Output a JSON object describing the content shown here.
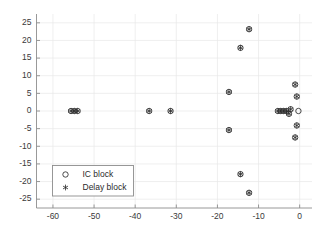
{
  "chart_data": {
    "type": "scatter",
    "title": "",
    "xlabel": "",
    "ylabel": "",
    "xlim": [
      -64,
      3
    ],
    "ylim": [
      -27.5,
      27.5
    ],
    "xticks": [
      -60,
      -50,
      -40,
      -30,
      -20,
      -10,
      0
    ],
    "xticklabels": [
      "-60",
      "-50",
      "-40",
      "-30",
      "-20",
      "-10",
      "0"
    ],
    "yticks": [
      -25,
      -20,
      -15,
      -10,
      -5,
      0,
      5,
      10,
      15,
      20,
      25
    ],
    "yticklabels": [
      "-25",
      "-20",
      "-15",
      "-10",
      "-5",
      "0",
      "5",
      "10",
      "15",
      "20",
      "25"
    ],
    "grid": true,
    "legend_position": "lower left",
    "series": [
      {
        "name": "IC block",
        "marker": "circle",
        "points": [
          [
            -55.6,
            0.0
          ],
          [
            -54.8,
            0.0
          ],
          [
            -54.0,
            0.0
          ],
          [
            -36.6,
            0.0
          ],
          [
            -31.4,
            0.0
          ],
          [
            -17.2,
            5.4
          ],
          [
            -17.2,
            -5.4
          ],
          [
            -14.4,
            17.9
          ],
          [
            -14.4,
            -17.9
          ],
          [
            -12.3,
            23.2
          ],
          [
            -12.3,
            -23.2
          ],
          [
            -1.1,
            7.5
          ],
          [
            -1.1,
            -7.5
          ],
          [
            -0.7,
            4.1
          ],
          [
            -0.7,
            -4.1
          ],
          [
            -0.3,
            0.0
          ],
          [
            -2.2,
            0.5
          ],
          [
            -2.6,
            -0.8
          ],
          [
            -3.2,
            0.0
          ],
          [
            -3.9,
            0.0
          ],
          [
            -4.6,
            0.0
          ],
          [
            -5.3,
            0.0
          ]
        ]
      },
      {
        "name": "Delay block",
        "marker": "asterisk",
        "points": [
          [
            -55.6,
            0.0
          ],
          [
            -54.8,
            0.0
          ],
          [
            -54.0,
            0.0
          ],
          [
            -36.6,
            0.0
          ],
          [
            -31.4,
            0.0
          ],
          [
            -17.2,
            5.4
          ],
          [
            -17.2,
            -5.4
          ],
          [
            -14.4,
            17.9
          ],
          [
            -14.4,
            -17.9
          ],
          [
            -12.3,
            23.2
          ],
          [
            -12.3,
            -23.2
          ],
          [
            -1.1,
            7.5
          ],
          [
            -1.1,
            -7.5
          ],
          [
            -0.7,
            4.1
          ],
          [
            -0.7,
            -4.1
          ],
          [
            -2.2,
            0.5
          ],
          [
            -2.6,
            -0.8
          ],
          [
            -3.2,
            0.0
          ],
          [
            -3.9,
            0.0
          ],
          [
            -4.6,
            0.0
          ],
          [
            -5.3,
            0.0
          ]
        ]
      }
    ]
  },
  "legend": {
    "entries": [
      {
        "label": "IC block",
        "marker": "circle"
      },
      {
        "label": "Delay block",
        "marker": "asterisk"
      }
    ]
  },
  "colors": {
    "marker": "#2a2a2a",
    "axis": "#8d8d8d",
    "grid": "#e8e8e8",
    "background": "#ffffff",
    "text": "#3a3a3a"
  }
}
